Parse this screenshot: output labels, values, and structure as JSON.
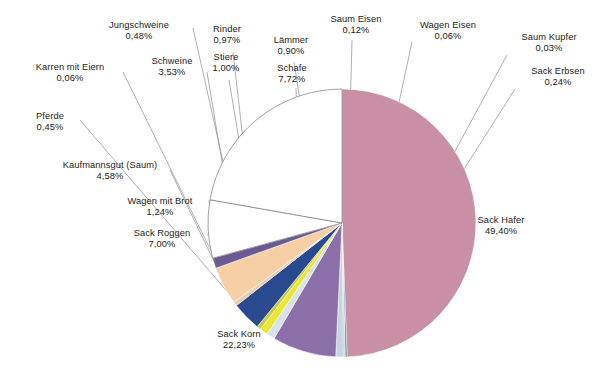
{
  "chart_data": {
    "type": "pie",
    "title": "",
    "subtitle": "",
    "legend_position": "none",
    "labels_show_percent": true,
    "decimal_separator": ",",
    "total_percent": 100.0,
    "categories": [
      "Sack Hafer",
      "Sack Erbsen",
      "Saum Kupfer",
      "Wagen Eisen",
      "Saum Eisen",
      "Lämmer",
      "Schafe",
      "Stiere",
      "Rinder",
      "Jungschweine",
      "Schweine",
      "Pferde",
      "Karren mit Eiern",
      "Kaufmannsgut (Saum)",
      "Wagen mit Brot",
      "Sack Roggen",
      "Sack Korn"
    ],
    "values": [
      49.4,
      0.24,
      0.03,
      0.06,
      0.12,
      0.9,
      7.72,
      1.0,
      0.97,
      0.48,
      3.53,
      0.45,
      0.06,
      4.58,
      1.24,
      7.0,
      22.23
    ],
    "value_texts": [
      "49,40%",
      "0,24%",
      "0,03%",
      "0,06%",
      "0,12%",
      "0,90%",
      "7,72%",
      "1,00%",
      "0,97%",
      "0,48%",
      "3,53%",
      "0,45%",
      "0,06%",
      "4,58%",
      "1,24%",
      "7,00%",
      "22,23%"
    ],
    "colors": [
      "#c98fa4",
      "#4a8f8f",
      "#6f6f4a",
      "#3d5f8a",
      "#8a8a35",
      "#c5d5e2",
      "#8a6fa8",
      "#d7e2ec",
      "#e8e832",
      "#c9c94a",
      "#2a4a8f",
      "#f2c9a0",
      "#7a5f8f",
      "#f7cfa5",
      "#6a5a8f",
      "#ffffff",
      "#ffffff"
    ],
    "slices": [
      {
        "label": "Sack Hafer",
        "percent": 49.4,
        "text": "49,40%",
        "color": "#c98fa4"
      },
      {
        "label": "Sack Erbsen",
        "percent": 0.24,
        "text": "0,24%",
        "color": "#4a8f8f"
      },
      {
        "label": "Saum Kupfer",
        "percent": 0.03,
        "text": "0,03%",
        "color": "#6f6f4a"
      },
      {
        "label": "Wagen Eisen",
        "percent": 0.06,
        "text": "0,06%",
        "color": "#3d5f8a"
      },
      {
        "label": "Saum Eisen",
        "percent": 0.12,
        "text": "0,12%",
        "color": "#8a8a35"
      },
      {
        "label": "Lämmer",
        "percent": 0.9,
        "text": "0,90%",
        "color": "#c5d5e2"
      },
      {
        "label": "Schafe",
        "percent": 7.72,
        "text": "7,72%",
        "color": "#8a6fa8"
      },
      {
        "label": "Stiere",
        "percent": 1.0,
        "text": "1,00%",
        "color": "#d7e2ec"
      },
      {
        "label": "Rinder",
        "percent": 0.97,
        "text": "0,97%",
        "color": "#e8e832"
      },
      {
        "label": "Jungschweine",
        "percent": 0.48,
        "text": "0,48%",
        "color": "#c9c94a"
      },
      {
        "label": "Schweine",
        "percent": 3.53,
        "text": "3,53%",
        "color": "#2a4a8f"
      },
      {
        "label": "Pferde",
        "percent": 0.45,
        "text": "0,45%",
        "color": "#f2c9a0"
      },
      {
        "label": "Karren mit Eiern",
        "percent": 0.06,
        "text": "0,06%",
        "color": "#7a5f8f"
      },
      {
        "label": "Kaufmannsgut (Saum)",
        "percent": 4.58,
        "text": "4,58%",
        "color": "#f7cfa5"
      },
      {
        "label": "Wagen mit Brot",
        "percent": 1.24,
        "text": "1,24%",
        "color": "#6a5a8f"
      },
      {
        "label": "Sack Roggen",
        "percent": 7.0,
        "text": "7,00%",
        "color": "#ffffff"
      },
      {
        "label": "Sack Korn",
        "percent": 22.23,
        "text": "22,23%",
        "color": "#ffffff"
      }
    ]
  },
  "labels": [
    {
      "id": "jungschweine",
      "name": "Jungschweine",
      "pct": "0,48%"
    },
    {
      "id": "rinder",
      "name": "Rinder",
      "pct": "0,97%"
    },
    {
      "id": "laemmer",
      "name": "Lämmer",
      "pct": "0,90%"
    },
    {
      "id": "saum-eisen",
      "name": "Saum Eisen",
      "pct": "0,12%"
    },
    {
      "id": "wagen-eisen",
      "name": "Wagen Eisen",
      "pct": "0,06%"
    },
    {
      "id": "saum-kupfer",
      "name": "Saum Kupfer",
      "pct": "0,03%"
    },
    {
      "id": "karren-mit-eiern",
      "name": "Karren mit Eiern",
      "pct": "0,06%"
    },
    {
      "id": "schweine",
      "name": "Schweine",
      "pct": "3,53%"
    },
    {
      "id": "stiere",
      "name": "Stiere",
      "pct": "1,00%"
    },
    {
      "id": "schafe",
      "name": "Schafe",
      "pct": "7,72%"
    },
    {
      "id": "sack-erbsen",
      "name": "Sack Erbsen",
      "pct": "0,24%"
    },
    {
      "id": "pferde",
      "name": "Pferde",
      "pct": "0,45%"
    },
    {
      "id": "kaufmannsgut",
      "name": "Kaufmannsgut (Saum)",
      "pct": "4,58%"
    },
    {
      "id": "wagen-mit-brot",
      "name": "Wagen mit Brot",
      "pct": "1,24%"
    },
    {
      "id": "sack-roggen",
      "name": "Sack Roggen",
      "pct": "7,00%"
    },
    {
      "id": "sack-hafer",
      "name": "Sack Hafer",
      "pct": "49,40%"
    },
    {
      "id": "sack-korn",
      "name": "Sack Korn",
      "pct": "22,23%"
    }
  ]
}
